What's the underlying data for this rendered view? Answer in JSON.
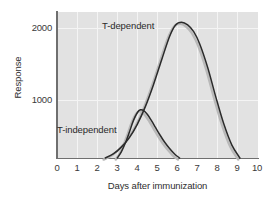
{
  "chart_data": {
    "type": "line",
    "title": "",
    "xlabel": "Days after immunization",
    "ylabel": "Response",
    "xlim": [
      0,
      10
    ],
    "ylim": [
      0,
      2150
    ],
    "xticks": [
      "0",
      "1",
      "2",
      "3",
      "4",
      "5",
      "6",
      "7",
      "8",
      "9",
      "10"
    ],
    "yticks": [
      "1000",
      "2000"
    ],
    "ytick_values": [
      1000,
      2000
    ],
    "grid": true,
    "grid_color": "#f4f4f4",
    "plot_background": "#e2e2e2",
    "legend_position": "inline-annotation",
    "series": [
      {
        "name": "T-dependent",
        "color": "#2b2b2b",
        "annotation": "T-dependent",
        "peak_x": 6.1,
        "peak_y": 2000,
        "onset_x": 2.4,
        "end_x": 9.1,
        "x": [
          2.4,
          2.8,
          3.2,
          3.6,
          4.0,
          4.4,
          4.8,
          5.2,
          5.6,
          5.9,
          6.2,
          6.5,
          6.8,
          7.1,
          7.5,
          7.9,
          8.3,
          8.7,
          9.1
        ],
        "y": [
          0,
          60,
          160,
          300,
          500,
          760,
          1080,
          1440,
          1790,
          1960,
          2000,
          1960,
          1860,
          1680,
          1330,
          900,
          500,
          190,
          0
        ]
      },
      {
        "name": "T-independent",
        "color": "#2b2b2b",
        "annotation": "T-independent",
        "peak_x": 4.1,
        "peak_y": 710,
        "onset_x": 3.0,
        "end_x": 6.1,
        "x": [
          3.0,
          3.2,
          3.4,
          3.6,
          3.8,
          4.0,
          4.15,
          4.3,
          4.5,
          4.7,
          4.9,
          5.1,
          5.35,
          5.6,
          5.85,
          6.1
        ],
        "y": [
          0,
          90,
          220,
          380,
          550,
          670,
          710,
          700,
          640,
          550,
          450,
          350,
          235,
          140,
          60,
          0
        ]
      }
    ]
  },
  "axes": {
    "y_title": "Response",
    "x_title": "Days after immunization",
    "y_tick_2000": "2000",
    "y_tick_1000": "1000",
    "x_tick_0": "0",
    "x_tick_1": "1",
    "x_tick_2": "2",
    "x_tick_3": "3",
    "x_tick_4": "4",
    "x_tick_5": "5",
    "x_tick_6": "6",
    "x_tick_7": "7",
    "x_tick_8": "8",
    "x_tick_9": "9",
    "x_tick_10": "10"
  },
  "annotations": {
    "t_dependent": "T-dependent",
    "t_independent": "T-independent"
  },
  "colors": {
    "curve": "#2b2b2b",
    "curve_shadow": "#b9b9b9",
    "axis": "#6f6f6f",
    "plot_bg": "#e2e2e2",
    "grid": "#f4f4f4",
    "text": "#2e2e2e"
  }
}
